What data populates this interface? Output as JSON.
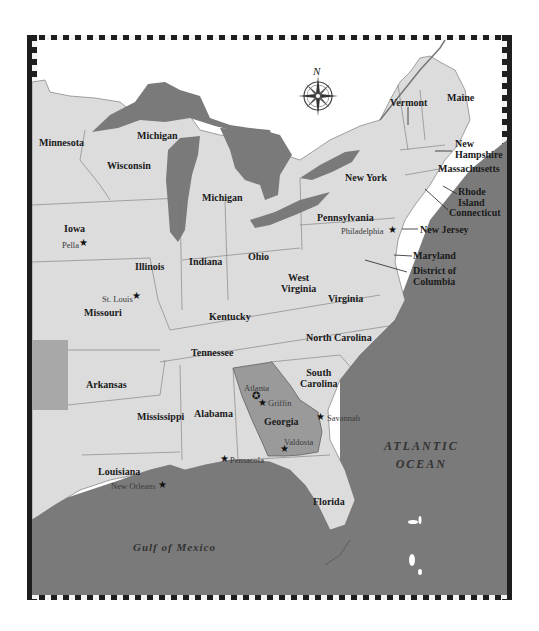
{
  "map": {
    "colors": {
      "land": "#dcdcdc",
      "water": "#7a7a7a",
      "highlight": "#9a9a9a",
      "canada_blank": "#ffffff",
      "border": "#1e1e1e"
    },
    "compass": {
      "north_label": "N"
    },
    "states": [
      {
        "name": "Minnesota"
      },
      {
        "name": "Michigan",
        "note": "upper peninsula"
      },
      {
        "name": "Wisconsin"
      },
      {
        "name": "Michigan",
        "note": "lower peninsula"
      },
      {
        "name": "Iowa"
      },
      {
        "name": "Illinois"
      },
      {
        "name": "Indiana"
      },
      {
        "name": "Ohio"
      },
      {
        "name": "Pennsylvania"
      },
      {
        "name": "New York"
      },
      {
        "name": "Vermont"
      },
      {
        "name": "Maine"
      },
      {
        "name": "New Hampshire"
      },
      {
        "name": "Massachusetts"
      },
      {
        "name": "Rhode Island"
      },
      {
        "name": "Connecticut"
      },
      {
        "name": "New Jersey"
      },
      {
        "name": "Maryland"
      },
      {
        "name": "District of Columbia"
      },
      {
        "name": "West Virginia"
      },
      {
        "name": "Virginia"
      },
      {
        "name": "Kentucky"
      },
      {
        "name": "Missouri"
      },
      {
        "name": "Tennessee"
      },
      {
        "name": "North Carolina"
      },
      {
        "name": "South Carolina"
      },
      {
        "name": "Arkansas"
      },
      {
        "name": "Mississippi"
      },
      {
        "name": "Alabama"
      },
      {
        "name": "Georgia"
      },
      {
        "name": "Louisiana"
      },
      {
        "name": "Florida"
      }
    ],
    "state_labels": {
      "minnesota": "Minnesota",
      "michigan_upper": "Michigan",
      "wisconsin": "Wisconsin",
      "michigan_lower": "Michigan",
      "iowa": "Iowa",
      "illinois": "Illinois",
      "indiana": "Indiana",
      "ohio": "Ohio",
      "pennsylvania": "Pennsylvania",
      "new_york": "New York",
      "vermont": "Vermont",
      "maine": "Maine",
      "new_hampshire_1": "New",
      "new_hampshire_2": "Hampshire",
      "massachusetts": "Massachusetts",
      "rhode_island_1": "Rhode",
      "rhode_island_2": "Island",
      "connecticut": "Connecticut",
      "new_jersey": "New Jersey",
      "maryland": "Maryland",
      "dc_1": "District of",
      "dc_2": "Columbia",
      "west_virginia_1": "West",
      "west_virginia_2": "Virginia",
      "virginia": "Virginia",
      "kentucky": "Kentucky",
      "missouri": "Missouri",
      "tennessee": "Tennessee",
      "north_carolina": "North Carolina",
      "south_carolina_1": "South",
      "south_carolina_2": "Carolina",
      "arkansas": "Arkansas",
      "mississippi": "Mississippi",
      "alabama": "Alabama",
      "georgia": "Georgia",
      "louisiana": "Louisiana",
      "florida": "Florida"
    },
    "cities": {
      "pella": "Pella",
      "st_louis": "St. Louis",
      "philadelphia": "Philadelphia",
      "atlanta": "Atlanta",
      "griffin": "Griffin",
      "savannah": "Savannah",
      "valdosta": "Valdosta",
      "pensacola": "Pensacola",
      "new_orleans": "New Orleans"
    },
    "star_glyph": "★",
    "capital_glyph": "✪",
    "water_labels": {
      "atlantic_1": "ATLANTIC",
      "atlantic_2": "OCEAN",
      "gulf": "Gulf of Mexico"
    },
    "highlighted_state": "Georgia"
  }
}
